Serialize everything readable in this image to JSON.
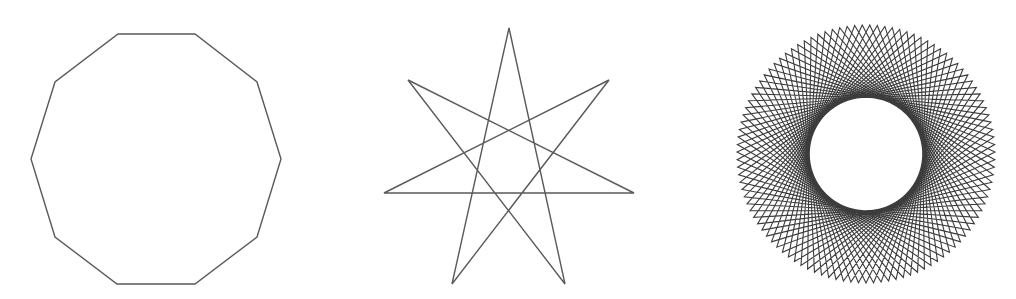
{
  "figures": [
    {
      "id": "decagon",
      "label": "Regular decagon",
      "sides": 10,
      "stroke": "#5a5a5a",
      "points": [
        [
          118,
          34
        ],
        [
          195,
          34
        ],
        [
          257,
          82
        ],
        [
          281,
          159
        ],
        [
          257,
          237
        ],
        [
          195,
          284
        ],
        [
          117,
          284
        ],
        [
          55,
          237
        ],
        [
          31,
          159
        ],
        [
          55,
          82
        ]
      ]
    },
    {
      "id": "heptagram",
      "label": "Seven-pointed star {7/3}",
      "points_count": 7,
      "step": 3,
      "stroke": "#5a5a5a",
      "vertices": [
        [
          509,
          28
        ],
        [
          609,
          80
        ],
        [
          634,
          193
        ],
        [
          565,
          284
        ],
        [
          452,
          284
        ],
        [
          384,
          193
        ],
        [
          408,
          80
        ]
      ]
    },
    {
      "id": "many-pointed-star",
      "label": "Many-pointed star polygon",
      "points_count": 107,
      "step": 38,
      "center": [
        866,
        154
      ],
      "radius": 129,
      "stroke": "#3c3c3c"
    }
  ]
}
